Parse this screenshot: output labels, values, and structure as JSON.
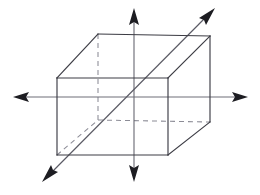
{
  "figure": {
    "canvas": {
      "width": 260,
      "height": 195,
      "background": "#ffffff"
    },
    "colors": {
      "solid_edge": "#3c3c44",
      "hidden_edge": "#8c8c96",
      "axis": "#6e6e78",
      "axis_diagonal": "#5a5a64",
      "arrow_head": "#1d1d22",
      "background": "#ffffff"
    },
    "style": {
      "hidden_edge_dash": "5 4",
      "solid_edge_width": 1.15,
      "hidden_edge_width": 1.05,
      "axis_width": 1.15
    }
  },
  "prism": {
    "name": "rectangular-prism",
    "projection": "oblique",
    "vertices": {
      "front_top_left": [
        57,
        78
      ],
      "front_top_right": [
        168,
        78
      ],
      "front_bottom_left": [
        57,
        155
      ],
      "front_bottom_right": [
        168,
        155
      ],
      "back_top_left": [
        98,
        34
      ],
      "back_top_right": [
        210,
        36
      ],
      "back_bottom_left": [
        98,
        120
      ],
      "back_bottom_right": [
        210,
        122
      ]
    },
    "solid_edges": [
      {
        "name": "front-top",
        "from": "front_top_left",
        "to": "front_top_right"
      },
      {
        "name": "front-right",
        "from": "front_top_right",
        "to": "front_bottom_right"
      },
      {
        "name": "front-bottom",
        "from": "front_bottom_right",
        "to": "front_bottom_left"
      },
      {
        "name": "front-left",
        "from": "front_bottom_left",
        "to": "front_top_left"
      },
      {
        "name": "top-left-receding",
        "from": "front_top_left",
        "to": "back_top_left"
      },
      {
        "name": "back-top",
        "from": "back_top_left",
        "to": "back_top_right"
      },
      {
        "name": "top-right-receding",
        "from": "front_top_right",
        "to": "back_top_right"
      },
      {
        "name": "back-right",
        "from": "back_top_right",
        "to": "back_bottom_right"
      },
      {
        "name": "bottom-right-receding",
        "from": "front_bottom_right",
        "to": "back_bottom_right"
      }
    ],
    "hidden_edges": [
      {
        "name": "back-left-vertical",
        "from": "back_top_left",
        "to": "back_bottom_left"
      },
      {
        "name": "back-bottom",
        "from": "back_bottom_left",
        "to": "back_bottom_right"
      },
      {
        "name": "bottom-left-receding",
        "from": "front_bottom_left",
        "to": "back_bottom_left"
      }
    ]
  },
  "axes": [
    {
      "name": "vertical-axis",
      "orientation": "vertical",
      "from": [
        134,
        14
      ],
      "to": [
        134,
        176
      ],
      "arrow_start": [
        134,
        8
      ],
      "arrow_end": [
        134,
        182
      ],
      "double_headed": true
    },
    {
      "name": "horizontal-axis",
      "orientation": "horizontal",
      "from": [
        19,
        97
      ],
      "to": [
        242,
        97
      ],
      "arrow_start": [
        13,
        97
      ],
      "arrow_end": [
        248,
        97
      ],
      "double_headed": true
    },
    {
      "name": "diagonal-axis",
      "orientation": "diagonal",
      "from": [
        48,
        176
      ],
      "to": [
        209,
        14
      ],
      "arrow_start": [
        42,
        182
      ],
      "arrow_end": [
        215,
        8
      ],
      "double_headed": true
    }
  ],
  "center": [
    134,
    97
  ]
}
